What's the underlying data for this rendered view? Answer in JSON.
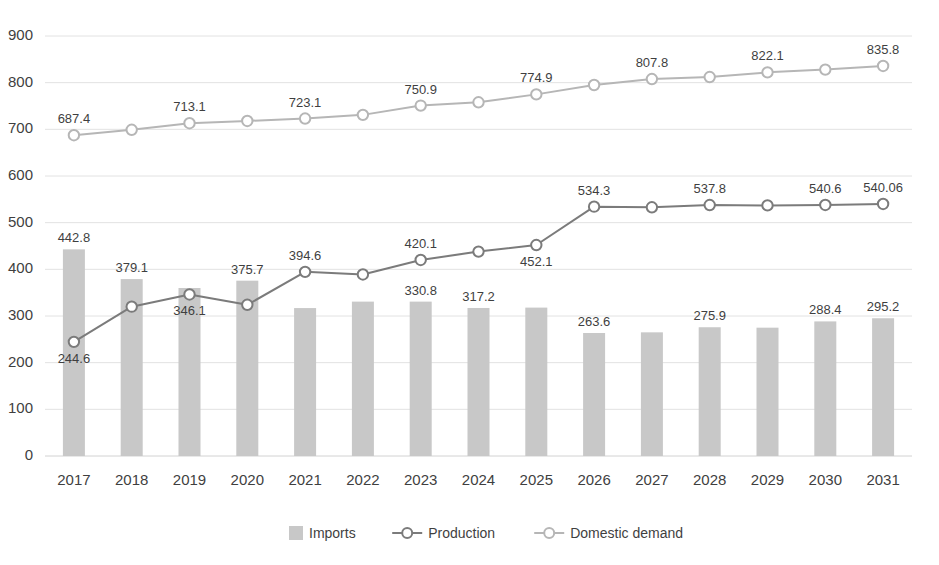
{
  "chart_data": {
    "type": "bar",
    "title": "",
    "subtitle": "",
    "xlabel": "",
    "ylabel": "",
    "ylim": [
      0,
      900
    ],
    "ytick_step": 100,
    "yticks": [
      "0",
      "100",
      "200",
      "300",
      "400",
      "500",
      "600",
      "700",
      "800",
      "900"
    ],
    "grid": true,
    "legend_position": "bottom",
    "categories": [
      "2017",
      "2018",
      "2019",
      "2020",
      "2021",
      "2022",
      "2023",
      "2024",
      "2025",
      "2026",
      "2027",
      "2028",
      "2029",
      "2030",
      "2031"
    ],
    "series": [
      {
        "name": "Imports",
        "kind": "bar",
        "color": "#c8c8c8",
        "values": [
          442.8,
          379.1,
          360.0,
          375.7,
          317.0,
          330.8,
          330.8,
          317.2,
          318.0,
          263.6,
          265.0,
          275.9,
          275.0,
          288.4,
          295.2
        ],
        "labels": [
          "442.8",
          "379.1",
          "",
          "375.7",
          "",
          "",
          "330.8",
          "317.2",
          "",
          "263.6",
          "",
          "275.9",
          "",
          "288.4",
          "295.2"
        ]
      },
      {
        "name": "Production",
        "kind": "line",
        "color": "#7b7b7b",
        "values": [
          244.6,
          320.0,
          346.1,
          324.0,
          394.6,
          389.0,
          420.1,
          438.0,
          452.1,
          534.3,
          533.0,
          537.8,
          537.0,
          538.0,
          540.06
        ],
        "labels": [
          "244.6",
          "",
          "346.1",
          "",
          "394.6",
          "",
          "420.1",
          "",
          "452.1",
          "534.3",
          "",
          "537.8",
          "",
          "540.6",
          "540.06"
        ],
        "label_positions": [
          "below",
          "",
          "below",
          "",
          "above",
          "",
          "above",
          "",
          "below",
          "above",
          "",
          "above",
          "",
          "above",
          "above"
        ]
      },
      {
        "name": "Domestic demand",
        "kind": "line",
        "color": "#b6b6b6",
        "values": [
          687.4,
          699.0,
          713.1,
          718.0,
          723.1,
          731.0,
          750.9,
          758.0,
          774.9,
          795.0,
          807.8,
          812.0,
          822.1,
          828.0,
          835.8
        ],
        "labels": [
          "687.4",
          "",
          "713.1",
          "",
          "723.1",
          "",
          "750.9",
          "",
          "774.9",
          "",
          "807.8",
          "",
          "822.1",
          "",
          "835.8"
        ],
        "label_positions": [
          "above",
          "",
          "above",
          "",
          "above",
          "",
          "above",
          "",
          "above",
          "",
          "above",
          "",
          "above",
          "",
          "above"
        ]
      }
    ],
    "legend": [
      {
        "label": "Imports",
        "marker": "swatch",
        "color": "#c8c8c8"
      },
      {
        "label": "Production",
        "marker": "line-circle",
        "color": "#7b7b7b"
      },
      {
        "label": "Domestic demand",
        "marker": "line-circle",
        "color": "#b6b6b6"
      }
    ]
  }
}
